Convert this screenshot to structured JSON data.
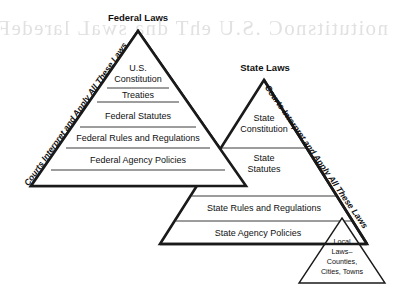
{
  "diagram": {
    "type": "hierarchy-pyramid",
    "title_federal": "Federal Laws",
    "title_state": "State Laws",
    "courts_note_left": "Courts Interpret and Apply All These Laws",
    "courts_note_right": "Courts Interpret and Apply All These Laws",
    "ghost_artifact": "scan bleed-through",
    "federal_pyramid": {
      "heading": "Federal Laws",
      "tiers": [
        {
          "line1": "U.S.",
          "line2": "Constitution"
        },
        {
          "line1": "Treaties",
          "line2": ""
        },
        {
          "line1": "Federal Statutes",
          "line2": ""
        },
        {
          "line1": "Federal Rules and Regulations",
          "line2": ""
        },
        {
          "line1": "Federal Agency Policies",
          "line2": ""
        }
      ]
    },
    "state_pyramid": {
      "heading": "State Laws",
      "tiers": [
        {
          "line1": "State",
          "line2": "Constitution"
        },
        {
          "line1": "State",
          "line2": "Statutes"
        },
        {
          "line1": "State Rules and Regulations",
          "line2": ""
        },
        {
          "line1": "State Agency Policies",
          "line2": ""
        }
      ]
    },
    "local_triangle": {
      "line1": "Local",
      "line2": "Laws–",
      "line3": "Counties,",
      "line4": "Cities, Towns"
    },
    "colors": {
      "stroke": "#1a1a1a",
      "fill": "#ffffff",
      "divider": "#3a3a3a",
      "background": "#ffffff",
      "ghost": "#c9c9c9"
    }
  }
}
